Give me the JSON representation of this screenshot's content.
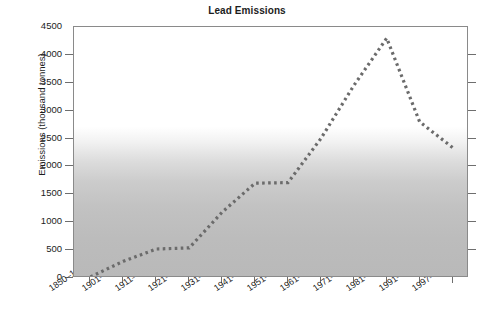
{
  "chart_data": {
    "type": "line",
    "title": "Lead Emissions",
    "xlabel": "",
    "ylabel": "Emissions (thousand tonnes)",
    "categories": [
      "1850–1900",
      "1901–1910",
      "1911–1920",
      "1921–1930",
      "1931–1940",
      "1941–1950",
      "1951–1960",
      "1961–1970",
      "1971–1980",
      "1981–1990",
      "1991–1996",
      "1997–2000"
    ],
    "values": [
      20,
      300,
      520,
      540,
      1180,
      1700,
      1710,
      2500,
      3450,
      4300,
      2800,
      2340
    ],
    "ylim": [
      0,
      4500
    ],
    "yticks": [
      0,
      500,
      1000,
      1500,
      2000,
      2500,
      3000,
      3500,
      4000,
      4500
    ],
    "ytick_labels": [
      "0",
      "500",
      "1000",
      "1500",
      "2000",
      "2500",
      "3000",
      "3500",
      "4000",
      "4500"
    ],
    "grid": false,
    "legend": null,
    "series_style": {
      "name": "Lead emissions",
      "line_style": "dotted",
      "color": "#6b6b6b",
      "marker": "square"
    },
    "background": {
      "type": "vertical-gradient",
      "top_color": "#ffffff",
      "bottom_color": "#b9b9b9",
      "fade_start_value": 2600
    },
    "axis_color": "#8a8a8a"
  }
}
